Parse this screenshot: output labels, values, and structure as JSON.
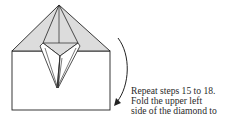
{
  "diagram": {
    "type": "origami-fold-step",
    "colors": {
      "fill_shaded": "#dcdcdc",
      "fill_paper": "#ffffff",
      "stroke": "#222222"
    }
  },
  "caption": {
    "lines": [
      "Repeat steps 15 to 18.",
      "Fold the upper left",
      "side of the diamond to"
    ]
  }
}
